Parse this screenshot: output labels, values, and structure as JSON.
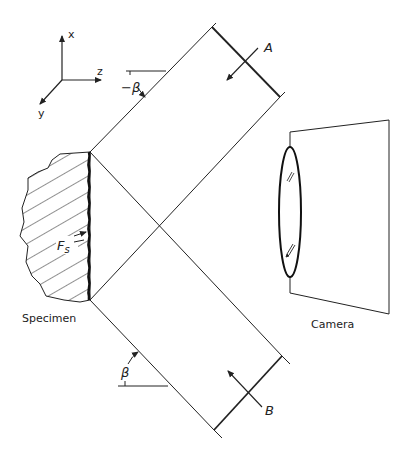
{
  "diagram": {
    "type": "optical setup schematic",
    "axes": {
      "x_label": "x",
      "y_label": "y",
      "z_label": "z"
    },
    "beam_a": {
      "label": "A",
      "angle_label": "−β"
    },
    "beam_b": {
      "label": "B",
      "angle_label": "β"
    },
    "specimen": {
      "label": "Specimen",
      "surface_label": "F",
      "surface_subscript": "s"
    },
    "camera": {
      "label": "Camera"
    },
    "colors": {
      "line": "#222222",
      "background": "#ffffff"
    }
  }
}
